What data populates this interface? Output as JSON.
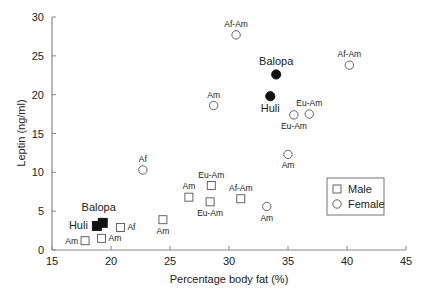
{
  "chart_data": {
    "type": "scatter",
    "title": "",
    "xlabel": "Percentage body fat (%)",
    "ylabel": "Leptin (ng/ml)",
    "xlim": [
      15,
      45
    ],
    "ylim": [
      0,
      30
    ],
    "xticks": [
      15,
      20,
      25,
      30,
      35,
      40,
      45
    ],
    "yticks": [
      0,
      5,
      10,
      15,
      20,
      25,
      30
    ],
    "grid": false,
    "legend": {
      "position": "lower right",
      "entries": [
        {
          "label": "Male",
          "marker": "open-square"
        },
        {
          "label": "Female",
          "marker": "open-circle"
        }
      ]
    },
    "series": [
      {
        "name": "Male",
        "marker": "square",
        "points": [
          {
            "x": 17.8,
            "y": 1.2,
            "label": "Am",
            "filled": false,
            "label_pos": "left"
          },
          {
            "x": 19.2,
            "y": 1.5,
            "label": "Am",
            "filled": false,
            "label_pos": "right"
          },
          {
            "x": 20.8,
            "y": 2.9,
            "label": "Af",
            "filled": false,
            "label_pos": "right"
          },
          {
            "x": 24.4,
            "y": 3.9,
            "label": "Am",
            "filled": false,
            "label_pos": "below"
          },
          {
            "x": 26.6,
            "y": 6.8,
            "label": "Am",
            "filled": false,
            "label_pos": "above"
          },
          {
            "x": 28.4,
            "y": 6.2,
            "label": "Eu-Am",
            "filled": false,
            "label_pos": "below"
          },
          {
            "x": 28.5,
            "y": 8.3,
            "label": "Eu-Am",
            "filled": false,
            "label_pos": "above"
          },
          {
            "x": 31.0,
            "y": 6.6,
            "label": "Af-Am",
            "filled": false,
            "label_pos": "above"
          },
          {
            "x": 18.8,
            "y": 3.1,
            "label": "Huli",
            "filled": true,
            "label_pos": "left"
          },
          {
            "x": 19.3,
            "y": 3.5,
            "label": "Balopa",
            "filled": true,
            "label_pos": "above"
          }
        ]
      },
      {
        "name": "Female",
        "marker": "circle",
        "points": [
          {
            "x": 22.7,
            "y": 10.3,
            "label": "Af",
            "filled": false,
            "label_pos": "above"
          },
          {
            "x": 28.7,
            "y": 18.6,
            "label": "Am",
            "filled": false,
            "label_pos": "above"
          },
          {
            "x": 30.6,
            "y": 27.7,
            "label": "Af-Am",
            "filled": false,
            "label_pos": "above"
          },
          {
            "x": 34.0,
            "y": 22.6,
            "label": "Balopa",
            "filled": true,
            "label_pos": "above"
          },
          {
            "x": 33.5,
            "y": 19.8,
            "label": "Huli",
            "filled": true,
            "label_pos": "below"
          },
          {
            "x": 40.2,
            "y": 23.8,
            "label": "Af-Am",
            "filled": false,
            "label_pos": "above"
          },
          {
            "x": 35.5,
            "y": 17.4,
            "label": "Eu-Am",
            "filled": false,
            "label_pos": "below"
          },
          {
            "x": 36.8,
            "y": 17.5,
            "label": "Eu-Am",
            "filled": false,
            "label_pos": "above"
          },
          {
            "x": 35.0,
            "y": 12.3,
            "label": "Am",
            "filled": false,
            "label_pos": "below"
          },
          {
            "x": 33.2,
            "y": 5.6,
            "label": "Am",
            "filled": false,
            "label_pos": "below"
          }
        ]
      }
    ]
  }
}
